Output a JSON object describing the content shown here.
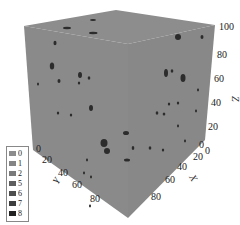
{
  "figure": {
    "type": "3d-voxel-cube",
    "axes": {
      "x": {
        "label": "X",
        "ticks": [
          "0",
          "20",
          "40",
          "60",
          "80"
        ]
      },
      "y": {
        "label": "Y",
        "ticks": [
          "0",
          "20",
          "40",
          "60",
          "80"
        ]
      },
      "z": {
        "label": "Z",
        "ticks": [
          "0",
          "20",
          "40",
          "60",
          "80",
          "100"
        ]
      }
    },
    "colors": {
      "matrix": "#8a8a8a",
      "inclusion": "#2a2a2a"
    }
  },
  "legend": {
    "items": [
      {
        "label": "0",
        "color": "#8c8c8c"
      },
      {
        "label": "1",
        "color": "#848484"
      },
      {
        "label": "2",
        "color": "#7a7a7a"
      },
      {
        "label": "5",
        "color": "#5e5e5e"
      },
      {
        "label": "6",
        "color": "#4e4e4e"
      },
      {
        "label": "7",
        "color": "#3e3e3e"
      },
      {
        "label": "8",
        "color": "#222222"
      }
    ]
  }
}
